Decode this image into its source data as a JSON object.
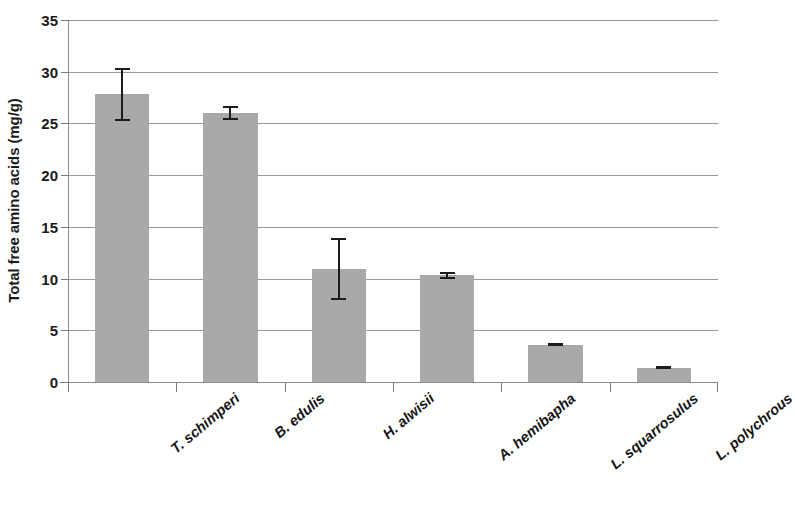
{
  "chart_data": {
    "type": "bar",
    "title": "",
    "xlabel": "",
    "ylabel": "Total free amino acids (mg/g)",
    "categories": [
      "T. schimperi",
      "B. edulis",
      "H. alwisii",
      "A. hemibapha",
      "L. squarrosulus",
      "L. polychrous"
    ],
    "values": [
      27.8,
      26.0,
      10.9,
      10.3,
      3.6,
      1.4
    ],
    "errors": [
      2.6,
      0.7,
      3.0,
      0.3,
      0.15,
      0.15
    ],
    "error_type": "symmetric",
    "ylim": [
      0,
      35
    ],
    "yticks": [
      0,
      5,
      10,
      15,
      20,
      25,
      30,
      35
    ],
    "ytick_labels": [
      "0",
      "5",
      "10",
      "15",
      "20",
      "25",
      "30",
      "35"
    ],
    "grid": "horizontal",
    "legend": "none",
    "bar_color": "#a9a9a9",
    "error_color": "#1c1c1c",
    "gridline_color": "#9a9a9a",
    "axis_color": "#8c8c8c",
    "background_color": "#ffffff",
    "xtick_label_rotation": -40,
    "xtick_label_style": "bold-italic"
  }
}
